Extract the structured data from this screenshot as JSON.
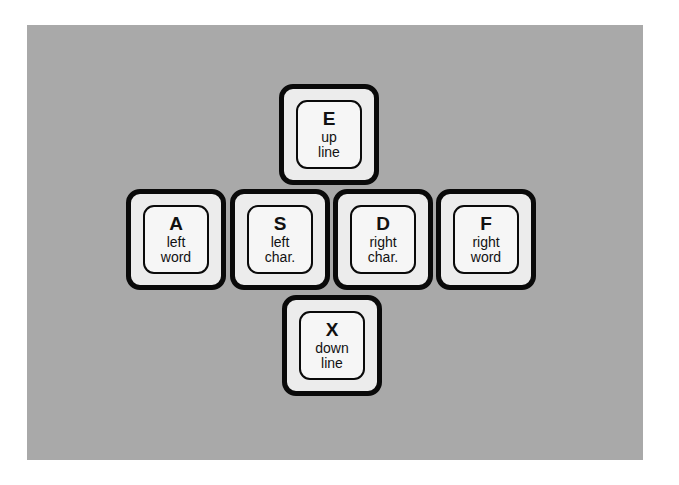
{
  "diagram": {
    "type": "keyboard-cursor-diamond",
    "colors": {
      "panel": "#a9a9a9",
      "key_face": "#ececec",
      "key_border": "#0a0a0a",
      "text": "#111111"
    },
    "keys": [
      {
        "id": "E",
        "letter": "E",
        "line1": "up",
        "line2": "line",
        "position": "top"
      },
      {
        "id": "A",
        "letter": "A",
        "line1": "left",
        "line2": "word",
        "position": "middle-1"
      },
      {
        "id": "S",
        "letter": "S",
        "line1": "left",
        "line2": "char.",
        "position": "middle-2"
      },
      {
        "id": "D",
        "letter": "D",
        "line1": "right",
        "line2": "char.",
        "position": "middle-3"
      },
      {
        "id": "F",
        "letter": "F",
        "line1": "right",
        "line2": "word",
        "position": "middle-4"
      },
      {
        "id": "X",
        "letter": "X",
        "line1": "down",
        "line2": "line",
        "position": "bottom"
      }
    ]
  }
}
